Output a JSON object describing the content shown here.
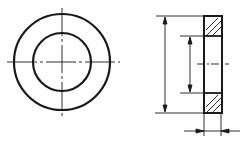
{
  "diagram": {
    "views": [
      {
        "name": "front-view",
        "shape": "concentric circles with centerlines"
      },
      {
        "name": "section-view",
        "shape": "sectioned rectangle with hatching and dimension lines"
      }
    ],
    "colors": {
      "line": "#1a1a1a",
      "background": "#ffffff"
    }
  }
}
